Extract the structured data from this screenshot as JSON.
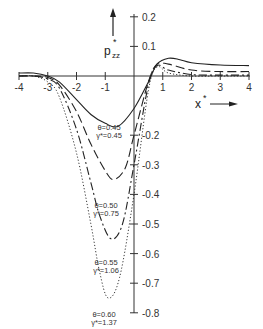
{
  "chart_data": {
    "type": "line",
    "title": "",
    "xlabel": "x*",
    "ylabel": "p*zz",
    "xlim": [
      -4,
      4
    ],
    "ylim": [
      -0.8,
      0.2
    ],
    "grid": false,
    "x_ticks": [
      "-4",
      "-3",
      "-2",
      "-1",
      "1",
      "2",
      "3",
      "4"
    ],
    "y_ticks": [
      "0.2",
      "0.1",
      "-0.2",
      "-0.3",
      "-0.4",
      "-0.5",
      "-0.6",
      "-0.7",
      "-0.8"
    ],
    "series": [
      {
        "name": "θ=0.45, γ*=0.45",
        "style": "solid",
        "x": [
          -4,
          -3.5,
          -3,
          -2.6,
          -2,
          -1.5,
          -1,
          -0.55,
          0,
          0.5,
          0.8,
          1.2,
          1.6,
          2,
          3,
          4
        ],
        "y": [
          0.01,
          0.01,
          0.0,
          -0.02,
          -0.08,
          -0.13,
          -0.16,
          -0.17,
          -0.11,
          -0.02,
          0.04,
          0.06,
          0.055,
          0.045,
          0.037,
          0.035
        ]
      },
      {
        "name": "θ=0.50, γ*=0.75",
        "style": "long-dash",
        "x": [
          -4,
          -3.5,
          -3,
          -2.6,
          -2,
          -1.5,
          -1,
          -0.7,
          -0.3,
          0,
          0.5,
          0.8,
          1.2,
          2,
          3,
          4
        ],
        "y": [
          0.0,
          0.0,
          -0.005,
          -0.03,
          -0.12,
          -0.23,
          -0.32,
          -0.35,
          -0.31,
          -0.2,
          -0.02,
          0.04,
          0.04,
          0.02,
          0.015,
          0.015
        ]
      },
      {
        "name": "θ=0.55, γ*=1.06",
        "style": "dash-dot",
        "x": [
          -4,
          -3.5,
          -3,
          -2.6,
          -2,
          -1.5,
          -1.2,
          -0.8,
          -0.4,
          0,
          0.5,
          0.8,
          1.2,
          2,
          3,
          4
        ],
        "y": [
          0.0,
          0.0,
          -0.01,
          -0.04,
          -0.18,
          -0.36,
          -0.47,
          -0.55,
          -0.5,
          -0.3,
          -0.03,
          0.035,
          0.02,
          0.005,
          0.003,
          0.003
        ]
      },
      {
        "name": "θ=0.60, γ*=1.37",
        "style": "dotted",
        "x": [
          -4,
          -3.5,
          -3,
          -2.6,
          -2,
          -1.5,
          -1.2,
          -0.9,
          -0.5,
          0,
          0.5,
          0.8,
          1.2,
          2,
          3,
          4
        ],
        "y": [
          0.0,
          0.0,
          -0.02,
          -0.07,
          -0.26,
          -0.5,
          -0.66,
          -0.75,
          -0.68,
          -0.4,
          -0.05,
          0.03,
          0.01,
          0.0,
          0.0,
          0.0
        ]
      }
    ],
    "annotations": [
      {
        "theta": "θ=0.45",
        "gamma": "γ*=0.45"
      },
      {
        "theta": "θ=0.50",
        "gamma": "γ*=0.75"
      },
      {
        "theta": "θ=0.55",
        "gamma": "γ*=1.06"
      },
      {
        "theta": "θ=0.60",
        "gamma": "γ*=1.37"
      }
    ]
  },
  "labels": {
    "y_axis_main": "p",
    "y_axis_sup": "*",
    "y_axis_sub": "zz",
    "x_axis_main": "x",
    "x_axis_sup": "*"
  }
}
